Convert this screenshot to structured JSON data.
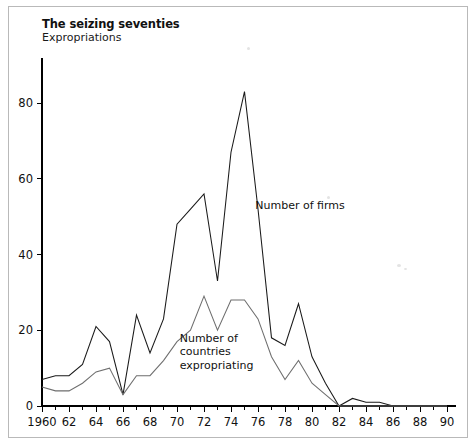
{
  "figure": {
    "title": "The seizing seventies",
    "subtitle": "Expropriations"
  },
  "chart_data": {
    "type": "line",
    "title": "The seizing seventies",
    "subtitle": "Expropriations",
    "xlabel": "",
    "ylabel": "",
    "xlim": [
      1960,
      1990
    ],
    "ylim": [
      0,
      92
    ],
    "yticks": [
      0,
      20,
      40,
      60,
      80
    ],
    "ytick_labels": [
      "0",
      "20",
      "40",
      "60",
      "80"
    ],
    "xticks": [
      1960,
      1962,
      1964,
      1966,
      1968,
      1970,
      1972,
      1974,
      1976,
      1978,
      1980,
      1982,
      1984,
      1986,
      1988,
      1990
    ],
    "xtick_labels": [
      "1960",
      "62",
      "64",
      "66",
      "68",
      "70",
      "72",
      "74",
      "76",
      "78",
      "80",
      "82",
      "84",
      "86",
      "88",
      "90"
    ],
    "x_minor_tick_step": 1,
    "grid": false,
    "legend_position": "inline-annotation",
    "x": [
      1960,
      1961,
      1962,
      1963,
      1964,
      1965,
      1966,
      1967,
      1968,
      1969,
      1970,
      1971,
      1972,
      1973,
      1974,
      1975,
      1976,
      1977,
      1978,
      1979,
      1980,
      1981,
      1982,
      1983,
      1984,
      1985,
      1986,
      1987,
      1988,
      1989,
      1990
    ],
    "series": [
      {
        "name": "Number of firms",
        "color": "#1a1a1a",
        "label_text": "Number of firms",
        "values": [
          7,
          8,
          8,
          11,
          21,
          17,
          3,
          24,
          14,
          23,
          48,
          52,
          56,
          33,
          67,
          83,
          52,
          18,
          16,
          27,
          13,
          6,
          0,
          2,
          1,
          1,
          0,
          0,
          0,
          0,
          0
        ]
      },
      {
        "name": "Number of countries expropriating",
        "color": "#6e6e6e",
        "label_text": "Number of\ncountries\nexpropriating",
        "label_lines": [
          "Number of",
          "countries",
          "expropriating"
        ],
        "values": [
          5,
          4,
          4,
          6,
          9,
          10,
          3,
          8,
          8,
          12,
          17,
          20,
          29,
          20,
          28,
          28,
          23,
          13,
          7,
          12,
          6,
          3,
          0,
          0,
          0,
          0,
          0,
          0,
          0,
          0,
          0
        ]
      }
    ],
    "annotations": [
      {
        "text": "Number of firms",
        "x": 1975.8,
        "y": 52
      },
      {
        "text": "Number of countries expropriating",
        "x": 1970.2,
        "y": 17
      }
    ]
  }
}
